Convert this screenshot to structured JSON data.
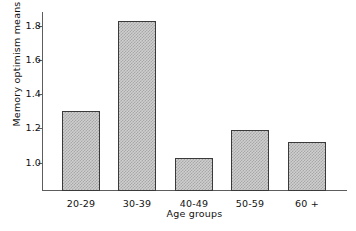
{
  "chart_data": {
    "type": "bar",
    "title": "",
    "subtitle": "",
    "xlabel": "Age groups",
    "ylabel": "Memory optimism means",
    "categories": [
      "20-29",
      "30-39",
      "40-49",
      "50-59",
      "60 +"
    ],
    "values": [
      1.3,
      1.83,
      1.03,
      1.19,
      1.12
    ],
    "ylim": [
      0.84,
      1.88
    ],
    "yticks": [
      1.0,
      1.2,
      1.4,
      1.6,
      1.8
    ],
    "ytick_labels": [
      "1.0",
      "1.2",
      "1.4",
      "1.6",
      "1.8"
    ],
    "grid": false,
    "legend": null,
    "legend_position": "none",
    "bar_fill_color": "#cfcfcf",
    "bar_hatch_color": "#a7a7a7",
    "bar_edge_color": "#3a3a3a",
    "axis_color": "#5d5d5d",
    "background_color": "#ffffff",
    "text_color": "#111111",
    "series": [
      {
        "name": "Memory optimism means",
        "values": [
          1.3,
          1.83,
          1.03,
          1.19,
          1.12
        ]
      }
    ]
  }
}
